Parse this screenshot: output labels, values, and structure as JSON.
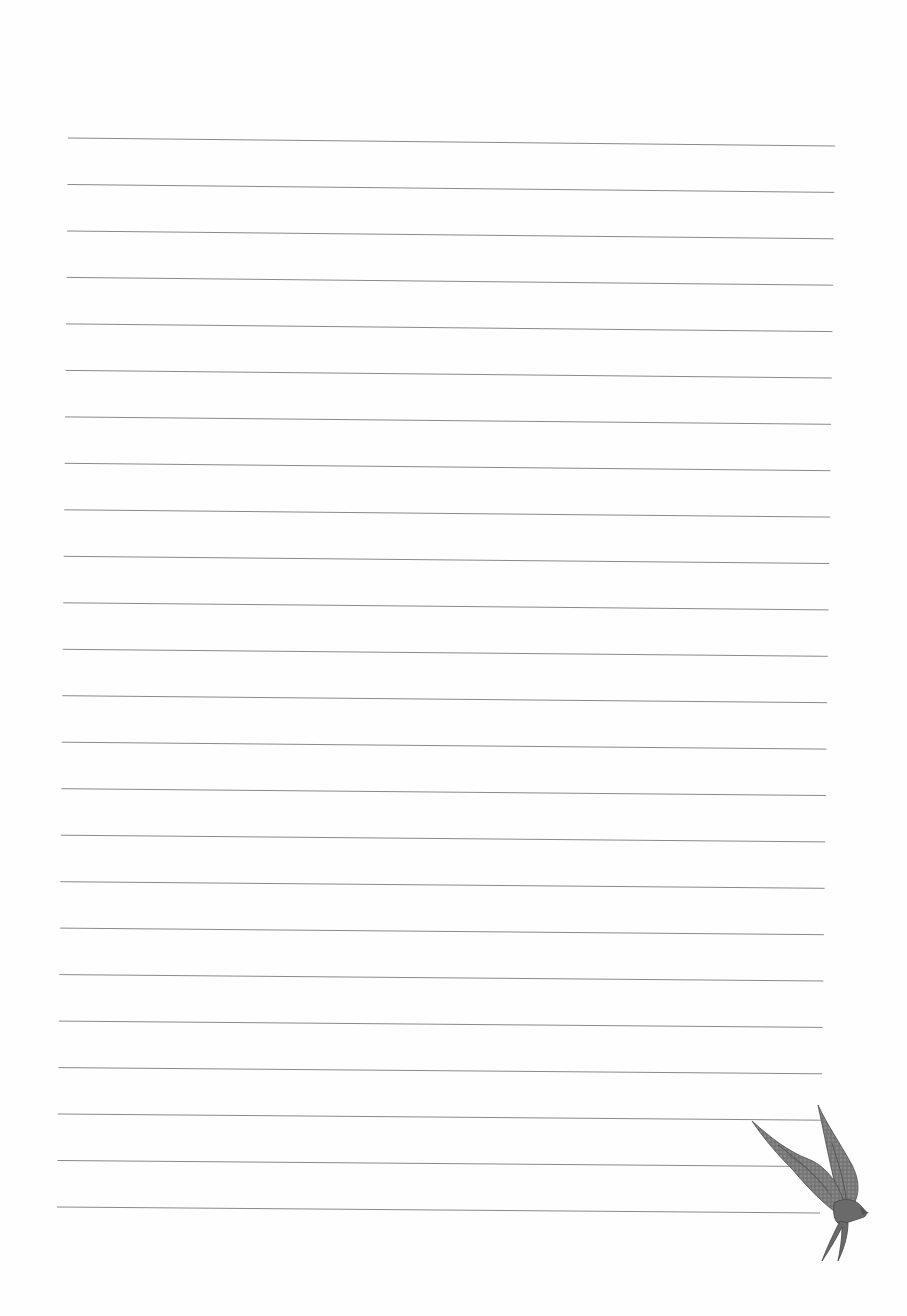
{
  "page": {
    "type": "lined-notebook-paper",
    "background": "#fefefe",
    "line_color": "#8a8a8a",
    "line_count": 24,
    "first_line": {
      "x1": 68,
      "y1": 138,
      "x2": 835,
      "y2": 146
    },
    "last_line": {
      "x1": 57,
      "y1": 1207,
      "x2": 820,
      "y2": 1213
    },
    "line_spacing": 46.5
  },
  "decoration": {
    "icon": "swallow-bird-icon",
    "color": "#6f6f6f"
  }
}
